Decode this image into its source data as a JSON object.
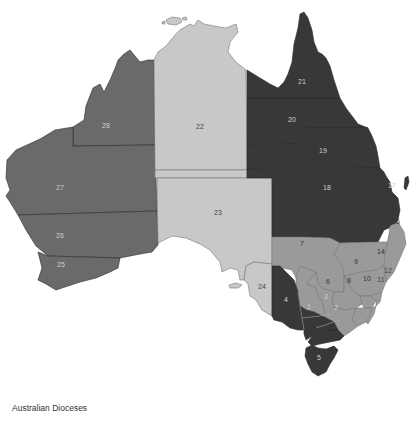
{
  "title": "Australian Dioceses",
  "colors": {
    "dark": "#383838",
    "medium": "#6a6a6a",
    "mid_light": "#9a9a9a",
    "light": "#c8c8c8",
    "background": "#ffffff"
  },
  "regions": [
    {
      "id": "1",
      "label": "1",
      "shade": "dark"
    },
    {
      "id": "2",
      "label": "2",
      "shade": "dark"
    },
    {
      "id": "3",
      "label": "3",
      "shade": "dark"
    },
    {
      "id": "4",
      "label": "4",
      "shade": "dark"
    },
    {
      "id": "5",
      "label": "5",
      "shade": "dark"
    },
    {
      "id": "6",
      "label": "6",
      "shade": "mid_light"
    },
    {
      "id": "7",
      "label": "7",
      "shade": "mid_light"
    },
    {
      "id": "8",
      "label": "8",
      "shade": "mid_light"
    },
    {
      "id": "9",
      "label": "9",
      "shade": "mid_light"
    },
    {
      "id": "10",
      "label": "10",
      "shade": "mid_light"
    },
    {
      "id": "11",
      "label": "11",
      "shade": "mid_light"
    },
    {
      "id": "12",
      "label": "12",
      "shade": "mid_light"
    },
    {
      "id": "13",
      "label": "13",
      "shade": "mid_light"
    },
    {
      "id": "14",
      "label": "14",
      "shade": "mid_light"
    },
    {
      "id": "15",
      "label": "15",
      "shade": "mid_light"
    },
    {
      "id": "16",
      "label": "16",
      "shade": "mid_light"
    },
    {
      "id": "17",
      "label": "17",
      "shade": "dark"
    },
    {
      "id": "18",
      "label": "18",
      "shade": "dark"
    },
    {
      "id": "19",
      "label": "19",
      "shade": "dark"
    },
    {
      "id": "20",
      "label": "20",
      "shade": "dark"
    },
    {
      "id": "21",
      "label": "21",
      "shade": "dark"
    },
    {
      "id": "22",
      "label": "22",
      "shade": "light"
    },
    {
      "id": "23",
      "label": "23",
      "shade": "light"
    },
    {
      "id": "24",
      "label": "24",
      "shade": "light"
    },
    {
      "id": "25",
      "label": "25",
      "shade": "medium"
    },
    {
      "id": "26",
      "label": "26",
      "shade": "medium"
    },
    {
      "id": "27",
      "label": "27",
      "shade": "medium"
    },
    {
      "id": "28",
      "label": "28",
      "shade": "medium"
    }
  ]
}
